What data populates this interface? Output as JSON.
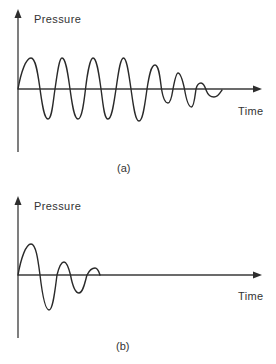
{
  "figure": {
    "panels": [
      {
        "id": "a",
        "y_axis_label": "Pressure",
        "x_axis_label": "Time",
        "caption": "(a)",
        "description": "Sustained oscillation: ~4 cycles of constant amplitude followed by decaying, higher-frequency oscillation"
      },
      {
        "id": "b",
        "y_axis_label": "Pressure",
        "x_axis_label": "Time",
        "caption": "(b)",
        "description": "Damped oscillation: amplitude decays quickly over ~2.5 cycles to zero"
      }
    ]
  },
  "colors": {
    "background": "#ffffff",
    "line": "#2a2a2a",
    "text": "#333333"
  }
}
